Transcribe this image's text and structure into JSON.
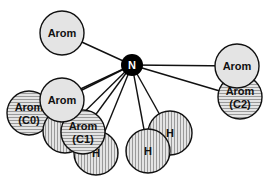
{
  "diagram": {
    "center_node": {
      "label": "N",
      "x": 132,
      "y": 65,
      "r": 11,
      "fill": "#000000"
    },
    "colors": {
      "plain_fill": "#e4e4e4",
      "stroke": "#111111",
      "stripe": "#9a9a9a",
      "background": "#ffffff"
    },
    "nodes": [
      {
        "id": "c2",
        "line1": "Arom",
        "line2": "(C2)",
        "pattern": "horizontal",
        "x": 240,
        "y": 97,
        "r": 22
      },
      {
        "id": "arom-right",
        "line1": "Arom",
        "line2": "",
        "pattern": "plain",
        "x": 237,
        "y": 66,
        "r": 22
      },
      {
        "id": "arom-top",
        "line1": "Arom",
        "line2": "",
        "pattern": "plain",
        "x": 62,
        "y": 33,
        "r": 22
      },
      {
        "id": "h-right",
        "line1": "H",
        "line2": "",
        "pattern": "vertical",
        "x": 170,
        "y": 133,
        "r": 22
      },
      {
        "id": "h-center",
        "line1": "H",
        "line2": "",
        "pattern": "vertical",
        "x": 148,
        "y": 151,
        "r": 22
      },
      {
        "id": "h-left",
        "line1": "H",
        "line2": "",
        "pattern": "vertical",
        "x": 96,
        "y": 153,
        "r": 22
      },
      {
        "id": "c0",
        "line1": "Arom",
        "line2": "(C0)",
        "pattern": "horizontal",
        "x": 29,
        "y": 113,
        "r": 22
      },
      {
        "id": "vstripe-back",
        "line1": "",
        "line2": "",
        "pattern": "vertical",
        "x": 65,
        "y": 131,
        "r": 22
      },
      {
        "id": "c1",
        "line1": "Arom",
        "line2": "(C1)",
        "pattern": "horizontal",
        "x": 83,
        "y": 132,
        "r": 22
      },
      {
        "id": "arom-center",
        "line1": "Arom",
        "line2": "",
        "pattern": "plain",
        "x": 62,
        "y": 100,
        "r": 22
      }
    ]
  }
}
